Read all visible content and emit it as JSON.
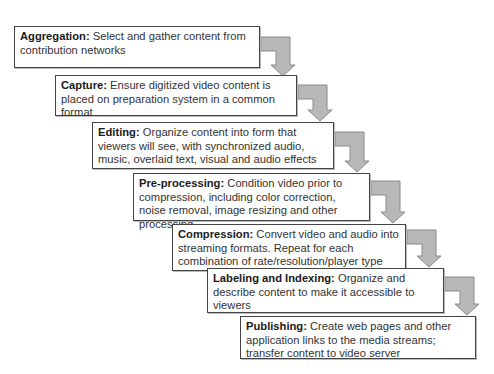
{
  "diagram": {
    "type": "staircase-flow",
    "colors": {
      "box_border": "#444444",
      "arrow_fill": "#b8b8b8",
      "arrow_stroke": "#8a8a8a",
      "text": "#333333"
    },
    "steps": [
      {
        "title": "Aggregation:",
        "text": " Select and gather content from contribution networks",
        "box": {
          "x": 14,
          "y": 26,
          "w": 246,
          "h": 42
        }
      },
      {
        "title": "Capture:",
        "text": " Ensure digitized video content is placed on preparation system in a common format",
        "box": {
          "x": 55,
          "y": 75,
          "w": 242,
          "h": 41
        }
      },
      {
        "title": "Editing:",
        "text": " Organize content into form that viewers will see, with synchronized audio, music, overlaid text, visual and audio effects",
        "box": {
          "x": 92,
          "y": 122,
          "w": 242,
          "h": 47
        }
      },
      {
        "title": "Pre-processing:",
        "text": " Condition video prior to compression, including color correction, noise removal, image resizing and other processing",
        "box": {
          "x": 133,
          "y": 173,
          "w": 237,
          "h": 48
        }
      },
      {
        "title": "Compression:",
        "text": " Convert video and audio into streaming formats. Repeat for each combination of rate/resolution/player type",
        "box": {
          "x": 172,
          "y": 224,
          "w": 234,
          "h": 47
        }
      },
      {
        "title": "Labeling and Indexing:",
        "text": " Organize and describe content to make it accessible to viewers",
        "box": {
          "x": 207,
          "y": 268,
          "w": 237,
          "h": 45
        }
      },
      {
        "title": "Publishing:",
        "text": " Create web pages and other application links to the media streams; transfer content to video server",
        "box": {
          "x": 240,
          "y": 316,
          "w": 236,
          "h": 43
        }
      }
    ],
    "arrows": [
      {
        "from": "Aggregation",
        "to": "Capture",
        "x1": 261,
        "y": 44,
        "x2": 283,
        "tip": 76
      },
      {
        "from": "Capture",
        "to": "Editing",
        "x1": 298,
        "y": 92,
        "x2": 320,
        "tip": 121
      },
      {
        "from": "Editing",
        "to": "Pre-processing",
        "x1": 335,
        "y": 139,
        "x2": 357,
        "tip": 172
      },
      {
        "from": "Pre-processing",
        "to": "Compression",
        "x1": 371,
        "y": 188,
        "x2": 393,
        "tip": 223
      },
      {
        "from": "Compression",
        "to": "Labeling and Indexing",
        "x1": 407,
        "y": 237,
        "x2": 429,
        "tip": 267
      },
      {
        "from": "Labeling and Indexing",
        "to": "Publishing",
        "x1": 445,
        "y": 284,
        "x2": 467,
        "tip": 315
      }
    ]
  }
}
